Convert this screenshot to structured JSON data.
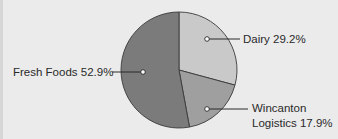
{
  "chart_data": {
    "type": "pie",
    "title": "",
    "slices": [
      {
        "label": "Dairy",
        "value": 29.2,
        "display": "Dairy 29.2%",
        "color": "#c9c9c9"
      },
      {
        "label": "Wincanton Logistics",
        "value": 17.9,
        "display_line1": "Wincanton",
        "display_line2": "Logistics 17.9%",
        "color": "#9f9f9f"
      },
      {
        "label": "Fresh Foods",
        "value": 52.9,
        "display": "Fresh Foods 52.9%",
        "color": "#7b7b7b"
      }
    ],
    "start_angle_deg": 0,
    "direction": "clockwise",
    "legend": "none (leader-line labels)"
  },
  "colors": {
    "background": "#ebebeb",
    "outline": "#3a3a3a",
    "leader": "#2a2a2a"
  }
}
